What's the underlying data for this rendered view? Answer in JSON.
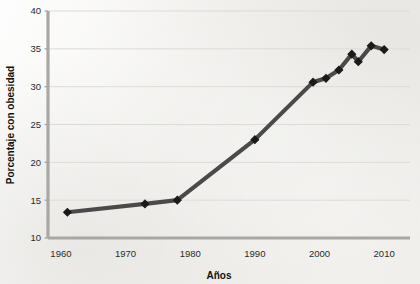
{
  "chart_data": {
    "type": "line",
    "title": "",
    "xlabel": "Años",
    "ylabel": "Porcentaje con obesidad",
    "xlim": [
      1958,
      2014
    ],
    "ylim": [
      10,
      40
    ],
    "xticks": [
      1960,
      1970,
      1980,
      1990,
      2000,
      2010
    ],
    "xtick_labels": [
      "1960",
      "1970",
      "1980",
      "1990",
      "2000",
      "2010"
    ],
    "yticks": [
      10,
      15,
      20,
      25,
      30,
      35,
      40
    ],
    "ytick_labels": [
      "10",
      "15",
      "20",
      "25",
      "30",
      "35",
      "40"
    ],
    "grid": "horizontal",
    "legend": "none",
    "marker": "diamond",
    "line_color": "#4a4a4a",
    "marker_color": "#1a1a1a",
    "axis_color": "#a9a7a3",
    "grid_color": "#dddbd6",
    "background_color": "#f4f3f1",
    "x": [
      1961,
      1973,
      1978,
      1990,
      1999,
      2001,
      2003,
      2005,
      2006,
      2008,
      2010
    ],
    "values": [
      13.4,
      14.5,
      15.0,
      23.0,
      30.6,
      31.1,
      32.2,
      34.3,
      33.3,
      35.4,
      34.9
    ],
    "series": [
      {
        "name": "Porcentaje con obesidad",
        "x": [
          1961,
          1973,
          1978,
          1990,
          1999,
          2001,
          2003,
          2005,
          2006,
          2008,
          2010
        ],
        "values": [
          13.4,
          14.5,
          15.0,
          23.0,
          30.6,
          31.1,
          32.2,
          34.3,
          33.3,
          35.4,
          34.9
        ]
      }
    ]
  }
}
